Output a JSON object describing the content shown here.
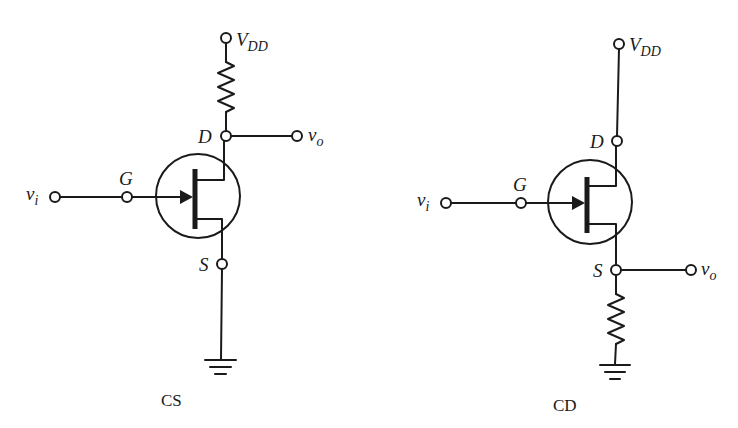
{
  "diagram": {
    "circuits": [
      {
        "id": "cs",
        "caption": "CS",
        "labels": {
          "supply_main": "V",
          "supply_sub": "DD",
          "drain": "D",
          "gate": "G",
          "source": "S",
          "input_main": "v",
          "input_sub": "i",
          "output_main": "v",
          "output_sub": "o"
        },
        "load_resistor_position": "drain",
        "output_node": "drain"
      },
      {
        "id": "cd",
        "caption": "CD",
        "labels": {
          "supply_main": "V",
          "supply_sub": "DD",
          "drain": "D",
          "gate": "G",
          "source": "S",
          "input_main": "v",
          "input_sub": "i",
          "output_main": "v",
          "output_sub": "o"
        },
        "load_resistor_position": "source",
        "output_node": "source"
      }
    ],
    "icons": {
      "transistor": "n-channel-jfet-symbol",
      "resistor": "zigzag-resistor-symbol",
      "ground": "ground-symbol",
      "terminal": "open-circle-terminal"
    },
    "colors": {
      "ink": "#1a1a1a",
      "background": "#ffffff"
    }
  }
}
